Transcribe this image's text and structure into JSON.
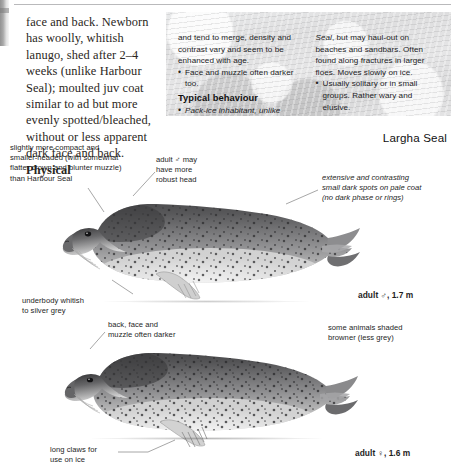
{
  "page": {
    "plate_title": "Largha Seal"
  },
  "body_text": {
    "paragraph": "face and back. Newborn has woolly, whitish lanugo, shed after 2–4 weeks (unlike Harbour Seal); moulted juv coat similar to ad but more evenly spotted/bleached, without or less apparent dark face and back. ",
    "bold_tail": "Physical"
  },
  "panel": {
    "left_column": {
      "continued_text": "and tend to merge, density and contrast vary and seem to be enhanced with age.",
      "bullet_1": "Face and muzzle often darker too.",
      "heading": "Typical behaviour",
      "bullet_2": "Pack-ice inhabitant, unlike Harbour"
    },
    "right_column": {
      "continued_italic": "Seal",
      "continued_text": ", but may haul-out on beaches and sandbars. Often found along fractures in larger floes. Moves slowly on ice.",
      "bullet_1": "Usually solitary or in small groups. Rather wary and elusive."
    }
  },
  "annotations": [
    {
      "id": "anno-compact",
      "text": "slightly more compact and\nsmaller-headed (with somewhat\nflatter crown and blunter muzzle)\nthan Harbour Seal"
    },
    {
      "id": "anno-robusthead",
      "text": "adult ♂ may\nhave more\nrobust head"
    },
    {
      "id": "anno-spots",
      "text": "extensive and contrasting\nsmall dark spots on pale coat\n(no dark phase or rings)"
    },
    {
      "id": "anno-underbody",
      "text": "underbody whitish\nto silver grey"
    },
    {
      "id": "anno-backface",
      "text": "back, face and\nmuzzle often darker"
    },
    {
      "id": "anno-browner",
      "text": "some animals shaded\nbrowner (less grey)"
    },
    {
      "id": "anno-claws",
      "text": "long claws for\nuse on ice"
    }
  ],
  "captions": {
    "upper_seal": "adult ♂, 1.7 m",
    "lower_seal": "adult ♀, 1.6 m"
  },
  "colors": {
    "page_background": "#ffffff",
    "panel_background": "#e2e2e3",
    "text": "#1e1e1e",
    "leader_line": "#8c8c8c",
    "seal_dark": "#4a4a4c",
    "seal_light": "#e8e8e8"
  }
}
